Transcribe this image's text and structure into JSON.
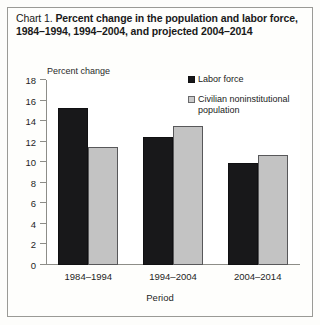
{
  "title": {
    "label": "Chart 1.",
    "text": "Percent change in the population and labor force, 1984–1994, 1994–2004, and projected 2004–2014"
  },
  "legend": {
    "position": "top-right",
    "items": [
      {
        "name": "Labor force",
        "swatch": "black-square-icon",
        "color": "#18181a"
      },
      {
        "name": "Civilian noninstitutional population",
        "swatch": "gray-square-icon",
        "color": "#c3c3c3"
      }
    ]
  },
  "chart_data": {
    "type": "bar",
    "title": "Percent change in the population and labor force, 1984–1994, 1994–2004, and projected 2004–2014",
    "categories": [
      "1984–1994",
      "1994–2004",
      "2004–2014"
    ],
    "series": [
      {
        "name": "Labor force",
        "values": [
          15.3,
          12.5,
          9.9
        ],
        "color": "#18181a"
      },
      {
        "name": "Civilian noninstitutional population",
        "values": [
          11.5,
          13.5,
          10.7
        ],
        "color": "#c3c3c3"
      }
    ],
    "xlabel": "Period",
    "ylabel": "Percent change",
    "ylim": [
      0,
      18
    ],
    "yticks": [
      0,
      2,
      4,
      6,
      8,
      10,
      12,
      14,
      16,
      18
    ],
    "ytick_labels": [
      "0",
      "2",
      "4",
      "6",
      "8",
      "10",
      "12",
      "14",
      "16",
      "18"
    ],
    "grid": false,
    "legend_position": "top-right"
  }
}
